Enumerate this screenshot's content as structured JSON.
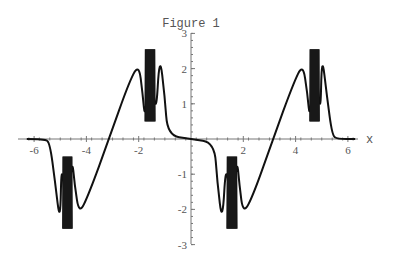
{
  "chart_data": {
    "type": "line",
    "title": "Figure 1",
    "xlabel": "x",
    "ylabel": "",
    "xlim": [
      -6.28,
      6.28
    ],
    "ylim": [
      -3,
      3
    ],
    "grid": false,
    "legend": null,
    "x_ticks": [
      -6,
      -4,
      -2,
      2,
      4,
      6
    ],
    "x_tick_labels": [
      "-6",
      "-4",
      "-2",
      "2",
      "4",
      "6"
    ],
    "y_ticks": [
      -3,
      -2,
      -1,
      1,
      2,
      3
    ],
    "y_tick_labels": [
      "-3",
      "-2",
      "-1",
      "1",
      "2",
      "3"
    ],
    "series": [
      {
        "name": "f(x)",
        "color": "#111111",
        "description": "Odd, 2π-periodic curve: flat at 0 near x=0, steep spike with dense oscillation band between |y|≈0.5 and |y|≈2.55 near |x|≈1.4–1.75, local extremum |y|≈2.15 at |x|≈2.0, linear crossing through 0 at x=±π",
        "x": [
          -6.28,
          -5.6,
          -5.4,
          -5.2,
          -5.0,
          -4.95,
          -4.75,
          -4.55,
          -4.45,
          -4.28,
          -3.9,
          -3.14,
          -2.4,
          -2.0,
          -1.85,
          -1.75,
          -1.55,
          -1.35,
          -1.2,
          -1.0,
          -0.9,
          0,
          0.9,
          1.0,
          1.2,
          1.35,
          1.55,
          1.75,
          1.85,
          2.0,
          2.4,
          3.14,
          3.9,
          4.28,
          4.45,
          4.55,
          4.75,
          4.95,
          5.0,
          5.2,
          5.4,
          5.6,
          6.28
        ],
        "y": [
          0,
          0,
          -0.1,
          -1.2,
          -2.45,
          -0.5,
          -2.55,
          -0.5,
          -1.3,
          -2.15,
          -1.55,
          0,
          1.55,
          2.15,
          1.3,
          0.5,
          2.55,
          0.5,
          2.45,
          1.2,
          0.1,
          0,
          -0.1,
          -1.2,
          -2.45,
          -0.5,
          -2.55,
          -0.5,
          -1.3,
          -2.15,
          -1.55,
          0,
          1.55,
          2.15,
          1.3,
          0.5,
          2.55,
          0.5,
          2.45,
          1.2,
          0.1,
          0,
          0
        ]
      }
    ],
    "oscillation_bands": [
      {
        "x_start": -4.9,
        "x_end": -4.55,
        "y_low": -2.55,
        "y_high": -0.5
      },
      {
        "x_start": -1.75,
        "x_end": -1.38,
        "y_low": 0.5,
        "y_high": 2.55
      },
      {
        "x_start": 1.38,
        "x_end": 1.75,
        "y_low": -2.55,
        "y_high": -0.5
      },
      {
        "x_start": 4.55,
        "x_end": 4.9,
        "y_low": 0.5,
        "y_high": 2.55
      }
    ]
  }
}
